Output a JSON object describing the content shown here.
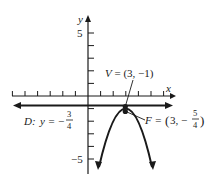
{
  "diagram": {
    "type": "parabola-graph",
    "axes": {
      "x_label": "x",
      "y_label": "y",
      "y_tick_labels": {
        "top": "5",
        "bottom": "−5"
      },
      "x_ticks": [
        -6,
        -5,
        -4,
        -3,
        -2,
        -1,
        1,
        2,
        3,
        4,
        5,
        6
      ],
      "y_ticks": [
        -5,
        -4,
        -3,
        -2,
        -1,
        1,
        2,
        3,
        4,
        5
      ]
    },
    "vertex": {
      "name": "V",
      "label": "V = (3, −1)",
      "x": 3,
      "y": -1
    },
    "focus": {
      "name": "F",
      "label_prefix": "F = ",
      "x_text": "3, −",
      "frac_num": "5",
      "frac_den": "4",
      "x": 3,
      "y": -1.25
    },
    "directrix": {
      "name": "D",
      "label_prefix": "D: ",
      "eq_text": "y = −",
      "frac_num": "3",
      "frac_den": "4",
      "y": -0.75
    },
    "colors": {
      "ink": "#1a1a1a",
      "background": "#ffffff"
    }
  }
}
